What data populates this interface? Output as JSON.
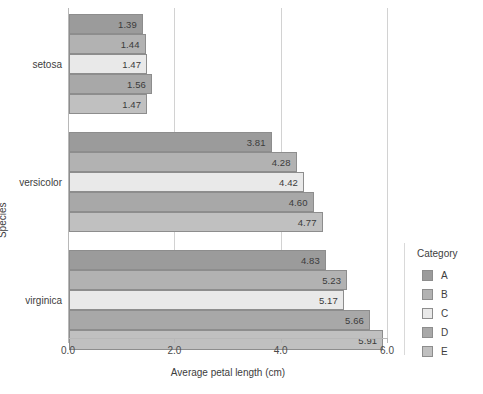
{
  "chart_data": {
    "type": "bar",
    "orientation": "horizontal",
    "title": "",
    "xlabel": "Average petal length (cm)",
    "ylabel": "Species",
    "xlim": [
      0.0,
      6.0
    ],
    "xticks": [
      "0.0",
      "2.0",
      "4.0",
      "6.0"
    ],
    "xtick_values": [
      0.0,
      2.0,
      4.0,
      6.0
    ],
    "grid": "vertical",
    "legend_title": "Category",
    "legend_position": "right",
    "categories": [
      "setosa",
      "versicolor",
      "virginica"
    ],
    "series": [
      {
        "name": "A",
        "color": "#9b9b9b",
        "values": [
          1.39,
          3.81,
          4.83
        ]
      },
      {
        "name": "B",
        "color": "#b2b2b2",
        "values": [
          1.44,
          4.28,
          5.23
        ]
      },
      {
        "name": "C",
        "color": "#e9e9e9",
        "values": [
          1.47,
          4.42,
          5.17
        ]
      },
      {
        "name": "D",
        "color": "#a8a8a8",
        "values": [
          1.56,
          4.6,
          5.66
        ]
      },
      {
        "name": "E",
        "color": "#c0c0c0",
        "values": [
          1.47,
          4.77,
          5.91
        ]
      }
    ],
    "bar_labels": [
      [
        "1.39",
        "1.44",
        "1.47",
        "1.56",
        "1.47"
      ],
      [
        "3.81",
        "4.28",
        "4.42",
        "4.60",
        "4.77"
      ],
      [
        "4.83",
        "5.23",
        "5.17",
        "5.66",
        "5.91"
      ]
    ]
  },
  "legend": {
    "title": "Category",
    "items": [
      {
        "label": "A",
        "color": "#9b9b9b"
      },
      {
        "label": "B",
        "color": "#b2b2b2"
      },
      {
        "label": "C",
        "color": "#e9e9e9"
      },
      {
        "label": "D",
        "color": "#a8a8a8"
      },
      {
        "label": "E",
        "color": "#c0c0c0"
      }
    ]
  },
  "axes": {
    "x_title": "Average petal length (cm)",
    "y_title": "Species",
    "x_tick_labels": [
      "0.0",
      "2.0",
      "4.0",
      "6.0"
    ],
    "y_tick_labels": [
      "setosa",
      "versicolor",
      "virginica"
    ]
  }
}
